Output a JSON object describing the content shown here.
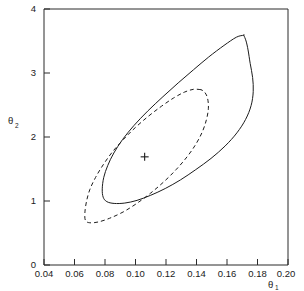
{
  "chart_data": {
    "type": "line",
    "title": "",
    "subtitle": "",
    "xlabel": "θ",
    "xlabel_sub": "1",
    "ylabel": "θ",
    "ylabel_sub": "2",
    "xlim": [
      0.04,
      0.2
    ],
    "ylim": [
      0,
      4
    ],
    "grid": false,
    "legend": "none",
    "xticks": [
      0.04,
      0.06,
      0.08,
      0.1,
      0.12,
      0.14,
      0.16,
      0.18,
      0.2
    ],
    "xtick_labels": [
      "0.04",
      "0.06",
      "0.08",
      "0.10",
      "0.12",
      "0.14",
      "0.16",
      "0.18",
      "0.20"
    ],
    "yticks": [
      0,
      1,
      2,
      3,
      4
    ],
    "ytick_labels": [
      "0",
      "1",
      "2",
      "3",
      "4"
    ],
    "annotations": [
      {
        "name": "point-estimate-cross",
        "symbol": "+",
        "x": 0.106,
        "y": 1.69
      }
    ],
    "series": [
      {
        "name": "solid-confidence-contour",
        "style": "solid",
        "color": "#1c1c1c",
        "closed": true,
        "points": [
          [
            0.171,
            3.59
          ],
          [
            0.1662,
            3.56
          ],
          [
            0.158,
            3.43
          ],
          [
            0.148,
            3.25
          ],
          [
            0.138,
            3.05
          ],
          [
            0.128,
            2.845
          ],
          [
            0.118,
            2.63
          ],
          [
            0.108,
            2.405
          ],
          [
            0.099,
            2.18
          ],
          [
            0.0915,
            1.96
          ],
          [
            0.0858,
            1.75
          ],
          [
            0.0818,
            1.555
          ],
          [
            0.0792,
            1.37
          ],
          [
            0.0782,
            1.19
          ],
          [
            0.0788,
            1.06
          ],
          [
            0.0812,
            0.99
          ],
          [
            0.086,
            0.962
          ],
          [
            0.093,
            0.968
          ],
          [
            0.101,
            1.01
          ],
          [
            0.11,
            1.09
          ],
          [
            0.1195,
            1.195
          ],
          [
            0.1295,
            1.33
          ],
          [
            0.1395,
            1.49
          ],
          [
            0.1495,
            1.665
          ],
          [
            0.1588,
            1.86
          ],
          [
            0.1665,
            2.065
          ],
          [
            0.1722,
            2.275
          ],
          [
            0.1758,
            2.49
          ],
          [
            0.1772,
            2.71
          ],
          [
            0.1768,
            2.93
          ],
          [
            0.1752,
            3.15
          ],
          [
            0.1738,
            3.36
          ],
          [
            0.1725,
            3.5
          ],
          [
            0.171,
            3.59
          ]
        ]
      },
      {
        "name": "dashed-confidence-contour",
        "style": "dashed",
        "color": "#1c1c1c",
        "closed": true,
        "points": [
          [
            0.1428,
            2.74
          ],
          [
            0.138,
            2.745
          ],
          [
            0.132,
            2.7
          ],
          [
            0.125,
            2.61
          ],
          [
            0.117,
            2.48
          ],
          [
            0.1085,
            2.325
          ],
          [
            0.1,
            2.15
          ],
          [
            0.092,
            1.96
          ],
          [
            0.0848,
            1.765
          ],
          [
            0.0788,
            1.565
          ],
          [
            0.0738,
            1.368
          ],
          [
            0.07,
            1.175
          ],
          [
            0.0678,
            0.985
          ],
          [
            0.0668,
            0.81
          ],
          [
            0.0672,
            0.695
          ],
          [
            0.07,
            0.66
          ],
          [
            0.0755,
            0.672
          ],
          [
            0.083,
            0.73
          ],
          [
            0.092,
            0.83
          ],
          [
            0.101,
            0.965
          ],
          [
            0.11,
            1.125
          ],
          [
            0.1188,
            1.305
          ],
          [
            0.1268,
            1.495
          ],
          [
            0.1338,
            1.69
          ],
          [
            0.1395,
            1.885
          ],
          [
            0.1438,
            2.08
          ],
          [
            0.1465,
            2.27
          ],
          [
            0.1478,
            2.45
          ],
          [
            0.1472,
            2.61
          ],
          [
            0.1452,
            2.705
          ],
          [
            0.1428,
            2.74
          ]
        ]
      }
    ]
  },
  "axes": {
    "x_axis_name": "theta-1-axis",
    "y_axis_name": "theta-2-axis"
  }
}
